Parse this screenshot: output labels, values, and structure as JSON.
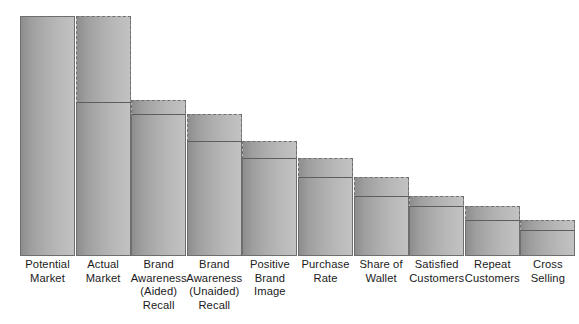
{
  "chart": {
    "title": "",
    "subtitle": "",
    "background_color": "#ffffff",
    "bar_fill_dark": "#8d8d8d",
    "bar_fill_light": "#c2c2c2",
    "outline_color": "#6e6e6e",
    "actual_line_color": "#5d5d5d"
  },
  "chart_data": {
    "type": "bar",
    "title": "",
    "xlabel": "",
    "ylabel": "",
    "grid": false,
    "legend": "none",
    "ylim": [
      0,
      100
    ],
    "axis_visible": false,
    "categories": [
      "Potential Market",
      "Actual Market",
      "Brand Awareness (Aided) Recall",
      "Brand Awareness (Unaided) Recall",
      "Positive Brand Image",
      "Purchase Rate",
      "Share of Wallet",
      "Satisfied Customers",
      "Repeat Customers",
      "Cross Selling"
    ],
    "series": [
      {
        "name": "Potential",
        "values": [
          100,
          100,
          65,
          59,
          48,
          41,
          33,
          25,
          21,
          15
        ]
      },
      {
        "name": "Actual",
        "values": [
          100,
          64,
          59,
          48,
          41,
          33,
          25,
          21,
          15,
          11
        ]
      }
    ]
  },
  "bars": [
    {
      "label_lines": [
        "Potential",
        "Market"
      ],
      "potential": 100,
      "actual": 100,
      "outline_style": "solid",
      "has_actual_line": false
    },
    {
      "label_lines": [
        "Actual",
        "Market"
      ],
      "potential": 100,
      "actual": 64,
      "outline_style": "dashed",
      "has_actual_line": true
    },
    {
      "label_lines": [
        "Brand",
        "Awareness",
        "(Aided)",
        "Recall"
      ],
      "potential": 65,
      "actual": 59,
      "outline_style": "dashed",
      "has_actual_line": true
    },
    {
      "label_lines": [
        "Brand",
        "Awareness",
        "(Unaided)",
        "Recall"
      ],
      "potential": 59,
      "actual": 48,
      "outline_style": "dashed",
      "has_actual_line": true
    },
    {
      "label_lines": [
        "Positive",
        "Brand",
        "Image"
      ],
      "potential": 48,
      "actual": 41,
      "outline_style": "dashed",
      "has_actual_line": true
    },
    {
      "label_lines": [
        "Purchase",
        "Rate"
      ],
      "potential": 41,
      "actual": 33,
      "outline_style": "dashed",
      "has_actual_line": true
    },
    {
      "label_lines": [
        "Share of",
        "Wallet"
      ],
      "potential": 33,
      "actual": 25,
      "outline_style": "dashed",
      "has_actual_line": true
    },
    {
      "label_lines": [
        "Satisfied",
        "Customers"
      ],
      "potential": 25,
      "actual": 21,
      "outline_style": "dashed",
      "has_actual_line": true
    },
    {
      "label_lines": [
        "Repeat",
        "Customers"
      ],
      "potential": 21,
      "actual": 15,
      "outline_style": "dashed",
      "has_actual_line": true
    },
    {
      "label_lines": [
        "Cross",
        "Selling"
      ],
      "potential": 15,
      "actual": 11,
      "outline_style": "dashed",
      "has_actual_line": true
    }
  ],
  "layout": {
    "bar_width_px": 55,
    "bar_pitch_px": 55.6,
    "first_bar_left_px": 20,
    "baseline_y_px": 256,
    "max_bar_height_px": 240
  }
}
